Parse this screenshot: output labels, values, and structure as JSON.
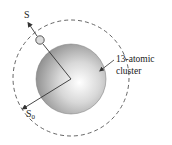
{
  "diagram": {
    "labels": {
      "s": "S",
      "s0": "S",
      "s0_sub": "0",
      "cluster_line1": "13-atomic",
      "cluster_line2": "cluster"
    },
    "colors": {
      "sphere_light": "#f2f2f2",
      "sphere_dark": "#8a8a8a",
      "line": "#333333",
      "dashed": "#555555",
      "small_atom": "#dcdcdc"
    }
  }
}
